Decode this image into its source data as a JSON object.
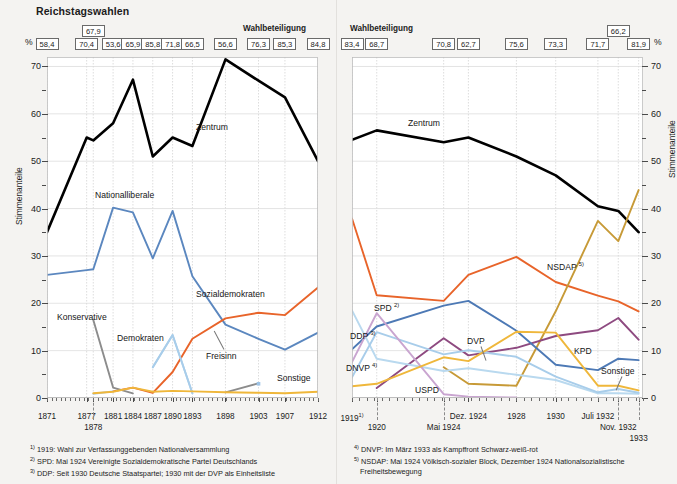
{
  "title": "Reichstagswahlen",
  "axis": {
    "y_label": "Stimmenanteile",
    "percent_symbol": "%",
    "turnout_caption": "Wahlbeteiligung",
    "yticks": [
      0,
      10,
      20,
      30,
      40,
      50,
      60,
      70
    ]
  },
  "footnotes_left": [
    "1919: Wahl zur Verfassunggebenden Nationalversammlung",
    "SPD: Mai 1924 Vereinigte Sozialdemokratische Partei Deutschlands",
    "DDP: Seit 1930 Deutsche Staatspartei; 1930 mit der DVP als Einheitsliste"
  ],
  "footnotes_left_marks": [
    "1)",
    "2)",
    "3)"
  ],
  "footnotes_right": [
    "DNVP: Im März 1933 als Kampffront Schwarz-weiß-rot",
    "NSDAP: Mai 1924 Völkisch-sozialer Block, Dezember 1924 Nationalsozialistische",
    "Freiheitsbewegung"
  ],
  "footnotes_right_marks": [
    "4)",
    "5)",
    ""
  ],
  "colors": {
    "zentrum": "#000000",
    "nationalliberale": "#5b87bf",
    "sozialdemokraten": "#e8642a",
    "konservative": "#8c8c8c",
    "demokraten_freisinn": "#a8cdea",
    "sonstige": "#efb73b",
    "dnvp": "#4d79b5",
    "ddp": "#b9d9ef",
    "dvp": "#a8cdea",
    "kpd": "#8e4a80",
    "uspd": "#c9a5d0",
    "nsdap": "#c79a37",
    "spd": "#e8642a",
    "grid": "#d9d9d9",
    "box_border": "#6a6a6a",
    "page_bg": "#f4f3f1"
  },
  "chart_data": [
    {
      "type": "line",
      "id": "kaiserreich",
      "title": "Reichstagswahlen",
      "xlabel": "",
      "ylabel": "Stimmenanteile",
      "ylim": [
        0,
        72
      ],
      "grid": true,
      "legend": "inline-labels",
      "categories": [
        "1871",
        "1877",
        "1878",
        "1881",
        "1884",
        "1887",
        "1890",
        "1893",
        "1898",
        "1903",
        "1907",
        "1912"
      ],
      "turnout": {
        "label": "Wahlbeteiligung",
        "unit": "%",
        "values": [
          58.4,
          70.4,
          67.9,
          53.6,
          65.9,
          85.8,
          71.8,
          66.5,
          56.6,
          76.3,
          85.3,
          84.8
        ],
        "raised_index": 2
      },
      "series": [
        {
          "name": "Zentrum",
          "color": "#000000",
          "values": [
            35.0,
            55.0,
            54.4,
            58.0,
            67.2,
            51.0,
            55.0,
            53.2,
            71.5,
            67.0,
            63.5,
            50.0
          ]
        },
        {
          "name": "Nationalliberale",
          "color": "#5b87bf",
          "values": [
            26.0,
            27.0,
            27.2,
            40.2,
            39.2,
            29.5,
            39.5,
            25.7,
            15.5,
            12.5,
            10.2,
            13.8
          ]
        },
        {
          "name": "Sozialdemokraten",
          "color": "#e8642a",
          "values": [
            null,
            null,
            null,
            1.4,
            2.2,
            1.1,
            5.5,
            12.5,
            16.8,
            18.0,
            17.5,
            23.3
          ]
        },
        {
          "name": "Konservative",
          "color": "#8c8c8c",
          "values": [
            null,
            null,
            16.5,
            2.2,
            1.0,
            null,
            null,
            null,
            1.2,
            3.1,
            null,
            null
          ]
        },
        {
          "name": "Demokraten",
          "color": "#a8cdea",
          "values": [
            null,
            null,
            0.9,
            1.4,
            null,
            6.5,
            13.3,
            1.0,
            null,
            null,
            null,
            null
          ]
        },
        {
          "name": "Freisinn",
          "color": "#a8cdea",
          "values": [
            null,
            null,
            null,
            null,
            null,
            6.5,
            13.3,
            1.0,
            null,
            null,
            null,
            null
          ]
        },
        {
          "name": "Sonstige",
          "color": "#efb73b",
          "values": [
            null,
            null,
            1.0,
            1.3,
            2.2,
            1.3,
            1.5,
            1.4,
            1.2,
            1.1,
            1.0,
            1.3
          ]
        }
      ],
      "series_labels": [
        {
          "text": "Zentrum",
          "x": 196,
          "y": 122
        },
        {
          "text": "Nationalliberale",
          "x": 95,
          "y": 190
        },
        {
          "text": "Sozialdemokraten",
          "x": 196,
          "y": 289
        },
        {
          "text": "Konservative",
          "x": 57,
          "y": 312
        },
        {
          "text": "Demokraten",
          "x": 117,
          "y": 333
        },
        {
          "text": "Freisinn",
          "x": 206,
          "y": 351
        },
        {
          "text": "Sonstige",
          "x": 277,
          "y": 373
        }
      ]
    },
    {
      "type": "line",
      "id": "weimar",
      "title": "",
      "xlabel": "",
      "ylabel": "Stimmenanteile",
      "ylim": [
        0,
        72
      ],
      "grid": true,
      "legend": "inline-labels",
      "categories": [
        "1919",
        "1920",
        "Mai 1924",
        "Dez. 1924",
        "1928",
        "1930",
        "Juli 1932",
        "Nov. 1932",
        "1933"
      ],
      "category_marks": [
        "1)",
        "",
        "",
        "",
        "",
        "",
        "",
        "",
        ""
      ],
      "turnout": {
        "label": "Wahlbeteiligung",
        "unit": "%",
        "values": [
          83.4,
          68.7,
          70.8,
          62.7,
          75.6,
          73.3,
          71.7,
          66.2,
          81.9
        ],
        "raised_index": 7
      },
      "series": [
        {
          "name": "Zentrum",
          "color": "#000000",
          "values": [
            54.5,
            56.5,
            54.0,
            55.0,
            51.0,
            47.0,
            40.5,
            39.5,
            35.0
          ]
        },
        {
          "name": "SPD",
          "color": "#e8642a",
          "mark": "2)",
          "values": [
            37.9,
            21.7,
            20.5,
            26.0,
            29.8,
            24.5,
            21.6,
            20.4,
            18.3
          ]
        },
        {
          "name": "NSDAP",
          "color": "#c79a37",
          "mark": "5)",
          "values": [
            null,
            null,
            6.5,
            3.0,
            2.6,
            18.3,
            37.4,
            33.1,
            43.9
          ]
        },
        {
          "name": "KPD",
          "color": "#8e4a80",
          "values": [
            null,
            2.1,
            12.6,
            9.0,
            10.6,
            13.1,
            14.3,
            16.9,
            12.3
          ]
        },
        {
          "name": "DNVP",
          "color": "#4d79b5",
          "mark": "4)",
          "values": [
            10.3,
            15.1,
            19.5,
            20.5,
            14.2,
            7.0,
            5.9,
            8.3,
            8.0
          ]
        },
        {
          "name": "DDP",
          "color": "#b9d9ef",
          "mark": "3)",
          "values": [
            18.5,
            8.3,
            5.7,
            6.3,
            4.9,
            3.8,
            1.0,
            1.0,
            0.9
          ]
        },
        {
          "name": "DVP",
          "color": "#a8cdea",
          "values": [
            4.4,
            13.9,
            9.2,
            10.1,
            8.7,
            4.5,
            1.2,
            1.9,
            1.1
          ]
        },
        {
          "name": "USPD",
          "color": "#c9a5d0",
          "values": [
            7.6,
            17.9,
            0.8,
            0.3,
            0.1,
            null,
            null,
            null,
            null
          ]
        },
        {
          "name": "Sonstige",
          "color": "#efb73b",
          "values": [
            2.5,
            3.0,
            8.6,
            7.8,
            14.0,
            13.8,
            2.6,
            2.6,
            1.6
          ]
        }
      ],
      "series_labels": [
        {
          "text": "Zentrum",
          "x": 72,
          "y": 118
        },
        {
          "text": "SPD",
          "x": 38,
          "y": 302,
          "mark": "2)"
        },
        {
          "text": "NSDAP",
          "x": 211,
          "y": 261,
          "mark": "5)"
        },
        {
          "text": "KPD",
          "x": 238,
          "y": 346
        },
        {
          "text": "DNVP",
          "x": 10,
          "y": 362,
          "mark": "4)"
        },
        {
          "text": "DDP",
          "x": 14,
          "y": 330,
          "mark": "3)"
        },
        {
          "text": "DVP",
          "x": 131,
          "y": 336
        },
        {
          "text": "USPD",
          "x": 79,
          "y": 385
        },
        {
          "text": "Sonstige",
          "x": 265,
          "y": 366
        }
      ]
    }
  ]
}
